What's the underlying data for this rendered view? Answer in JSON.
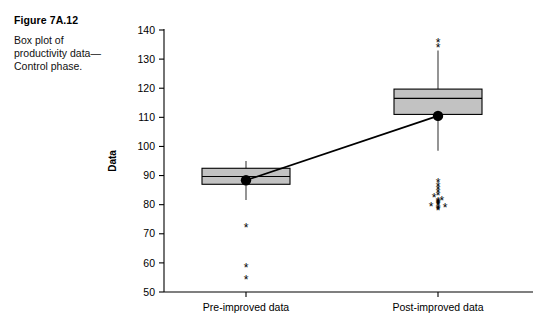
{
  "figure": {
    "caption_title": "Figure 7A.12",
    "caption_body": "Box plot of productivity data—Control phase."
  },
  "chart_data": {
    "type": "box",
    "title": "",
    "xlabel": "",
    "ylabel": "Data",
    "categories": [
      "Pre-improved data",
      "Post-improved data"
    ],
    "ylim": [
      50,
      140
    ],
    "yticks": [
      50,
      60,
      70,
      80,
      90,
      100,
      110,
      120,
      130,
      140
    ],
    "ytick_labels": [
      "50",
      "60",
      "70",
      "80",
      "90",
      "100",
      "110",
      "120",
      "130",
      "140"
    ],
    "grid": false,
    "legend": "none",
    "box_fill_color": "#c2c2c2",
    "box_edge_color": "#000000",
    "whisker_color": "#7a7a7a",
    "mean_marker_color": "#000000",
    "connect_line_color": "#000000",
    "outlier_marker": "*",
    "series": [
      {
        "name": "Pre-improved data",
        "q1": 87.0,
        "median": 89.7,
        "q3": 92.5,
        "mean": 88.4,
        "whisker_low": 81.6,
        "whisker_high": 95.0,
        "outliers": [
          72.0,
          58.2,
          54.1
        ]
      },
      {
        "name": "Post-improved data",
        "q1": 111.0,
        "median": 116.5,
        "q3": 119.7,
        "mean": 110.5,
        "whisker_low": 98.5,
        "whisker_high": 133.0,
        "outliers": [
          135.5,
          133.8,
          87.5,
          86.3,
          85.1,
          84.0,
          83.0,
          82.2,
          81.5,
          81.0,
          80.6,
          80.2,
          79.9,
          79.5,
          79.2,
          78.9,
          78.6,
          78.3,
          78.0
        ]
      }
    ],
    "mean_connect_line": {
      "from": {
        "category": "Pre-improved data",
        "value": 88.4
      },
      "to": {
        "category": "Post-improved data",
        "value": 110.5
      }
    }
  }
}
